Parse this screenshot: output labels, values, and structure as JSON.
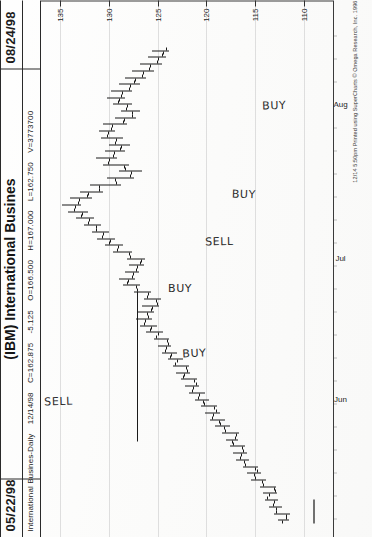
{
  "header": {
    "date_left": "05/22/98",
    "date_right": "08/24/98",
    "title": "(IBM) International Busines",
    "quote": {
      "symbol_line": "International Busines-Daily",
      "quote_date": "12/14/98",
      "close": "C=162.875",
      "change": "-5.125",
      "open": "O=166.500",
      "high": "H=167.000",
      "low": "L=162.750",
      "volume": "V=3773700"
    }
  },
  "footer": {
    "credit": "12/14 5:50pm Printed using SuperCharts © Omega Research, Inc. 1996"
  },
  "annotations": [
    {
      "label": "SELL",
      "x": 142,
      "y": 44
    },
    {
      "label": "BUY",
      "x": 190,
      "y": 182
    },
    {
      "label": "BUY",
      "x": 256,
      "y": 168
    },
    {
      "label": "SELL",
      "x": 302,
      "y": 205
    },
    {
      "label": "BUY",
      "x": 350,
      "y": 232
    },
    {
      "label": "BUY",
      "x": 438,
      "y": 262
    }
  ],
  "chart_data": {
    "type": "ohlc",
    "title": "(IBM) International Busines",
    "subtitle": "International Busines-Daily",
    "symbol": "IBM",
    "interval": "Daily",
    "xlabel": "",
    "ylabel": "Price",
    "ylim": [
      107,
      137
    ],
    "grid": false,
    "price_axis_position": "right",
    "price_ticks": [
      135,
      130,
      125,
      120,
      115,
      110
    ],
    "month_labels": [
      "Jun",
      "Jul",
      "Aug"
    ],
    "month_positions": [
      97,
      238,
      392
    ],
    "date_range": {
      "start": "05/22/98",
      "end": "08/24/98"
    },
    "last_quote": {
      "date": "12/14/98",
      "open": 166.5,
      "high": 167.0,
      "low": 162.75,
      "close": 162.875,
      "change": -5.125,
      "volume": 3773700
    },
    "signals": [
      {
        "type": "SELL",
        "index": 50
      },
      {
        "type": "BUY",
        "index": 36
      },
      {
        "type": "BUY",
        "index": 28
      },
      {
        "type": "SELL",
        "index": 21
      },
      {
        "type": "BUY",
        "index": 14
      },
      {
        "type": "BUY",
        "index": 5
      }
    ],
    "bars": [
      {
        "o": 112.2,
        "h": 112.6,
        "l": 111.5,
        "c": 111.8
      },
      {
        "o": 111.8,
        "h": 113.1,
        "l": 111.4,
        "c": 112.9
      },
      {
        "o": 112.9,
        "h": 113.6,
        "l": 112.2,
        "c": 113.2
      },
      {
        "o": 113.1,
        "h": 114.0,
        "l": 112.6,
        "c": 113.8
      },
      {
        "o": 113.6,
        "h": 114.2,
        "l": 112.8,
        "c": 113.0
      },
      {
        "o": 113.1,
        "h": 114.5,
        "l": 112.9,
        "c": 114.2
      },
      {
        "o": 114.3,
        "h": 115.4,
        "l": 113.9,
        "c": 115.0
      },
      {
        "o": 115.1,
        "h": 115.8,
        "l": 114.4,
        "c": 114.8
      },
      {
        "o": 115.0,
        "h": 116.2,
        "l": 114.7,
        "c": 116.0
      },
      {
        "o": 116.1,
        "h": 117.0,
        "l": 115.6,
        "c": 116.6
      },
      {
        "o": 116.5,
        "h": 117.3,
        "l": 115.8,
        "c": 116.2
      },
      {
        "o": 116.4,
        "h": 117.6,
        "l": 116.0,
        "c": 117.3
      },
      {
        "o": 117.4,
        "h": 118.0,
        "l": 116.8,
        "c": 117.1
      },
      {
        "o": 117.0,
        "h": 118.4,
        "l": 116.7,
        "c": 118.1
      },
      {
        "o": 118.2,
        "h": 119.1,
        "l": 117.6,
        "c": 118.6
      },
      {
        "o": 118.7,
        "h": 119.6,
        "l": 118.1,
        "c": 119.4
      },
      {
        "o": 119.3,
        "h": 120.2,
        "l": 118.6,
        "c": 119.0
      },
      {
        "o": 119.2,
        "h": 120.6,
        "l": 118.9,
        "c": 120.3
      },
      {
        "o": 120.4,
        "h": 121.2,
        "l": 119.7,
        "c": 120.9
      },
      {
        "o": 120.8,
        "h": 121.8,
        "l": 120.2,
        "c": 121.5
      },
      {
        "o": 121.4,
        "h": 122.2,
        "l": 120.8,
        "c": 121.1
      },
      {
        "o": 121.3,
        "h": 122.6,
        "l": 121.0,
        "c": 122.4
      },
      {
        "o": 122.3,
        "h": 123.1,
        "l": 121.7,
        "c": 122.0
      },
      {
        "o": 122.1,
        "h": 123.4,
        "l": 121.8,
        "c": 123.2
      },
      {
        "o": 123.0,
        "h": 124.0,
        "l": 122.4,
        "c": 123.7
      },
      {
        "o": 123.6,
        "h": 124.6,
        "l": 123.0,
        "c": 124.3
      },
      {
        "o": 124.2,
        "h": 125.0,
        "l": 123.6,
        "c": 124.0
      },
      {
        "o": 124.1,
        "h": 125.4,
        "l": 123.8,
        "c": 125.2
      },
      {
        "o": 125.0,
        "h": 126.2,
        "l": 124.5,
        "c": 125.8
      },
      {
        "o": 125.7,
        "h": 126.8,
        "l": 125.1,
        "c": 126.4
      },
      {
        "o": 126.3,
        "h": 127.2,
        "l": 125.6,
        "c": 126.0
      },
      {
        "o": 126.1,
        "h": 127.0,
        "l": 125.4,
        "c": 125.7
      },
      {
        "o": 125.6,
        "h": 126.6,
        "l": 124.9,
        "c": 125.1
      },
      {
        "o": 125.2,
        "h": 126.4,
        "l": 124.7,
        "c": 126.1
      },
      {
        "o": 126.0,
        "h": 127.4,
        "l": 125.7,
        "c": 127.1
      },
      {
        "o": 127.2,
        "h": 128.6,
        "l": 126.8,
        "c": 128.2
      },
      {
        "o": 128.1,
        "h": 129.0,
        "l": 127.3,
        "c": 127.6
      },
      {
        "o": 127.5,
        "h": 128.4,
        "l": 126.9,
        "c": 127.2
      },
      {
        "o": 127.1,
        "h": 128.0,
        "l": 126.4,
        "c": 126.8
      },
      {
        "o": 126.7,
        "h": 128.2,
        "l": 126.3,
        "c": 127.9
      },
      {
        "o": 128.0,
        "h": 129.6,
        "l": 127.6,
        "c": 129.2
      },
      {
        "o": 129.1,
        "h": 130.4,
        "l": 128.6,
        "c": 130.0
      },
      {
        "o": 129.9,
        "h": 131.2,
        "l": 129.4,
        "c": 130.7
      },
      {
        "o": 130.6,
        "h": 131.8,
        "l": 130.0,
        "c": 131.4
      },
      {
        "o": 131.3,
        "h": 132.6,
        "l": 130.8,
        "c": 132.2
      },
      {
        "o": 132.1,
        "h": 133.4,
        "l": 131.6,
        "c": 132.9
      },
      {
        "o": 132.8,
        "h": 134.2,
        "l": 132.2,
        "c": 133.6
      },
      {
        "o": 133.5,
        "h": 134.8,
        "l": 132.9,
        "c": 133.2
      },
      {
        "o": 133.1,
        "h": 134.0,
        "l": 131.8,
        "c": 132.3
      },
      {
        "o": 132.2,
        "h": 133.0,
        "l": 130.6,
        "c": 131.0
      },
      {
        "o": 131.0,
        "h": 132.0,
        "l": 128.8,
        "c": 129.3
      },
      {
        "o": 129.4,
        "h": 130.2,
        "l": 127.4,
        "c": 127.9
      },
      {
        "o": 127.8,
        "h": 129.0,
        "l": 126.6,
        "c": 128.4
      },
      {
        "o": 128.5,
        "h": 130.6,
        "l": 128.0,
        "c": 130.1
      },
      {
        "o": 130.0,
        "h": 131.4,
        "l": 129.2,
        "c": 129.6
      },
      {
        "o": 129.5,
        "h": 130.4,
        "l": 128.4,
        "c": 128.9
      },
      {
        "o": 128.8,
        "h": 130.0,
        "l": 127.9,
        "c": 129.4
      },
      {
        "o": 129.3,
        "h": 130.8,
        "l": 128.6,
        "c": 130.2
      },
      {
        "o": 130.1,
        "h": 131.0,
        "l": 129.4,
        "c": 129.8
      },
      {
        "o": 129.7,
        "h": 130.6,
        "l": 128.2,
        "c": 128.6
      },
      {
        "o": 128.5,
        "h": 129.4,
        "l": 127.2,
        "c": 127.7
      },
      {
        "o": 127.6,
        "h": 128.8,
        "l": 126.8,
        "c": 128.3
      },
      {
        "o": 128.2,
        "h": 129.6,
        "l": 127.6,
        "c": 129.1
      },
      {
        "o": 129.0,
        "h": 130.2,
        "l": 128.4,
        "c": 128.8
      },
      {
        "o": 128.7,
        "h": 129.8,
        "l": 127.6,
        "c": 128.0
      },
      {
        "o": 127.9,
        "h": 129.0,
        "l": 126.8,
        "c": 127.4
      },
      {
        "o": 127.3,
        "h": 128.4,
        "l": 126.2,
        "c": 126.6
      },
      {
        "o": 126.5,
        "h": 127.6,
        "l": 125.4,
        "c": 125.9
      },
      {
        "o": 125.8,
        "h": 126.8,
        "l": 124.6,
        "c": 125.1
      },
      {
        "o": 125.0,
        "h": 126.0,
        "l": 124.2,
        "c": 124.6
      },
      {
        "o": 124.5,
        "h": 125.6,
        "l": 123.8,
        "c": 124.2
      }
    ]
  }
}
